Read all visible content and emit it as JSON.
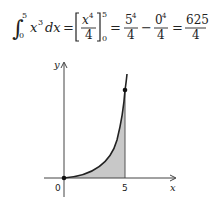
{
  "equation": {
    "integral_sign": "∫",
    "lower_limit": "0",
    "upper_limit": "5",
    "integrand": "x",
    "integrand_exp": "3",
    "differential": "dx",
    "eq1": "=",
    "antideriv_num_base": "x",
    "antideriv_num_exp": "4",
    "antideriv_den": "4",
    "eval_upper": "5",
    "eval_lower": "0",
    "eq2": "=",
    "term1_num_base": "5",
    "term1_num_exp": "4",
    "term1_den": "4",
    "minus": "−",
    "term2_num_base": "0",
    "term2_num_exp": "4",
    "term2_den": "4",
    "eq3": "=",
    "result_num": "625",
    "result_den": "4"
  },
  "graph": {
    "y_axis_label": "y",
    "x_axis_label": "x",
    "origin_label": "0",
    "x_tick_label": "5",
    "curve": "y = x^3",
    "shaded_interval": [
      0,
      5
    ],
    "fill_color": "#c8c8c8",
    "line_color": "#222222"
  }
}
